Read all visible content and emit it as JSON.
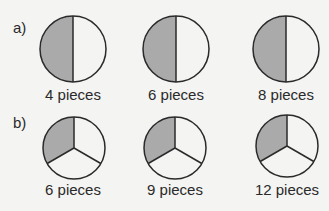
{
  "colors": {
    "shade": "#aaaaaa",
    "stroke": "#2a2a2a",
    "fill": "#ffffff",
    "background": "#f4f4f2"
  },
  "rows": [
    {
      "label": "a)",
      "division": "halves",
      "items": [
        {
          "caption": "4 pieces"
        },
        {
          "caption": "6 pieces"
        },
        {
          "caption": "8 pieces"
        }
      ]
    },
    {
      "label": "b)",
      "division": "thirds",
      "items": [
        {
          "caption": "6 pieces"
        },
        {
          "caption": "9 pieces"
        },
        {
          "caption": "12 pieces"
        }
      ]
    }
  ]
}
